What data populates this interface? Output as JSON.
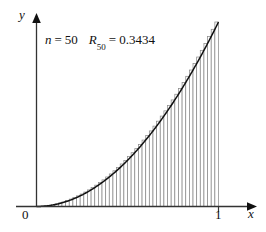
{
  "figure": {
    "name": "riemann-sum-right-endpoint-figure",
    "background_color": "#ffffff"
  },
  "annotation": {
    "n_symbol": "n",
    "equals": "=",
    "n_value": "50",
    "r_symbol": "R",
    "r_subscript": "50",
    "r_value": "0.3434",
    "full_text": "n = 50   R50 = 0.3434"
  },
  "axes": {
    "x_label": "x",
    "y_label": "y",
    "origin_label": "0",
    "x_tick_label": "1",
    "axis_color": "#333333",
    "arrow_color": "#111111"
  },
  "colors": {
    "curve": "#111111",
    "rectangle_stroke": "#8a8a8a",
    "rectangle_fill": "#ffffff"
  },
  "chart_data": {
    "type": "area",
    "title": "",
    "subtitle": "",
    "xlabel": "x",
    "ylabel": "y",
    "xlim": [
      0,
      1
    ],
    "ylim": [
      0,
      1
    ],
    "grid": false,
    "legend": "none",
    "function": "y = x^2",
    "n_rectangles": 50,
    "rule": "right-endpoint",
    "riemann_sum_value": 0.3434,
    "annotations": [
      "n = 50",
      "R50 = 0.3434"
    ],
    "x_tick_values": [
      0,
      1
    ],
    "x_tick_labels": [
      "0",
      "1"
    ],
    "y_tick_values": [],
    "y_tick_labels": [],
    "x": [
      0,
      0.02,
      0.04,
      0.06,
      0.08,
      0.1,
      0.12,
      0.14,
      0.16,
      0.18,
      0.2,
      0.22,
      0.24,
      0.26,
      0.28,
      0.3,
      0.32,
      0.34,
      0.36,
      0.38,
      0.4,
      0.42,
      0.44,
      0.46,
      0.48,
      0.5,
      0.52,
      0.54,
      0.56,
      0.58,
      0.6,
      0.62,
      0.64,
      0.66,
      0.68,
      0.7,
      0.72,
      0.74,
      0.76,
      0.78,
      0.8,
      0.82,
      0.84,
      0.86,
      0.88,
      0.9,
      0.92,
      0.94,
      0.96,
      0.98,
      1
    ],
    "y": [
      0,
      0.0004,
      0.0016,
      0.0036,
      0.0064,
      0.01,
      0.0144,
      0.0196,
      0.0256,
      0.0324,
      0.04,
      0.0484,
      0.0576,
      0.0676,
      0.0784,
      0.09,
      0.1024,
      0.1156,
      0.1296,
      0.1444,
      0.16,
      0.1764,
      0.1936,
      0.2116,
      0.2304,
      0.25,
      0.2704,
      0.2916,
      0.3136,
      0.3364,
      0.36,
      0.3844,
      0.4096,
      0.4356,
      0.4624,
      0.49,
      0.5184,
      0.5476,
      0.5776,
      0.6084,
      0.64,
      0.6724,
      0.7056,
      0.7396,
      0.7744,
      0.81,
      0.8464,
      0.8836,
      0.9216,
      0.9604,
      1
    ],
    "bar_right_endpoints": [
      0.02,
      0.04,
      0.06,
      0.08,
      0.1,
      0.12,
      0.14,
      0.16,
      0.18,
      0.2,
      0.22,
      0.24,
      0.26,
      0.28,
      0.3,
      0.32,
      0.34,
      0.36,
      0.38,
      0.4,
      0.42,
      0.44,
      0.46,
      0.48,
      0.5,
      0.52,
      0.54,
      0.56,
      0.58,
      0.6,
      0.62,
      0.64,
      0.66,
      0.68,
      0.7,
      0.72,
      0.74,
      0.76,
      0.78,
      0.8,
      0.82,
      0.84,
      0.86,
      0.88,
      0.9,
      0.92,
      0.94,
      0.96,
      0.98,
      1
    ],
    "bar_heights": [
      0.0004,
      0.0016,
      0.0036,
      0.0064,
      0.01,
      0.0144,
      0.0196,
      0.0256,
      0.0324,
      0.04,
      0.0484,
      0.0576,
      0.0676,
      0.0784,
      0.09,
      0.1024,
      0.1156,
      0.1296,
      0.1444,
      0.16,
      0.1764,
      0.1936,
      0.2116,
      0.2304,
      0.25,
      0.2704,
      0.2916,
      0.3136,
      0.3364,
      0.36,
      0.3844,
      0.4096,
      0.4356,
      0.4624,
      0.49,
      0.5184,
      0.5476,
      0.5776,
      0.6084,
      0.64,
      0.6724,
      0.7056,
      0.7396,
      0.7744,
      0.81,
      0.8464,
      0.8836,
      0.9216,
      0.9604,
      1
    ]
  }
}
